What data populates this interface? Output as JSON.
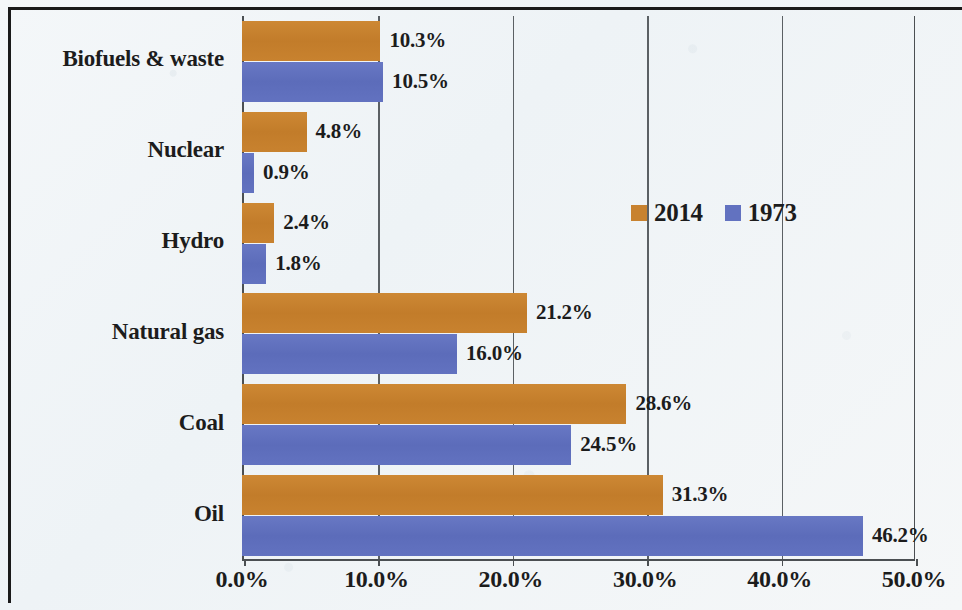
{
  "chart_data": {
    "type": "bar",
    "orientation": "horizontal",
    "title": "",
    "subtitle": "",
    "xlabel": "",
    "ylabel": "",
    "xlim": [
      0,
      50
    ],
    "xtick_labels": [
      "0.0%",
      "10.0%",
      "20.0%",
      "30.0%",
      "40.0%",
      "50.0%"
    ],
    "xticks": [
      0,
      10,
      20,
      30,
      40,
      50
    ],
    "grid": true,
    "grid_axis": "x",
    "legend_position": "inside-right-upper",
    "categories": [
      "Biofuels & waste",
      "Nuclear",
      "Hydro",
      "Natural gas",
      "Coal",
      "Oil"
    ],
    "series": [
      {
        "name": "2014",
        "color": "#c8822f",
        "values": [
          10.3,
          4.8,
          2.4,
          21.2,
          28.6,
          31.3
        ],
        "labels": [
          "10.3%",
          "4.8%",
          "2.4%",
          "21.2%",
          "28.6%",
          "31.3%"
        ]
      },
      {
        "name": "1973",
        "color": "#6272c0",
        "values": [
          10.5,
          0.9,
          1.8,
          16.0,
          24.5,
          46.2
        ],
        "labels": [
          "10.5%",
          "0.9%",
          "1.8%",
          "16.0%",
          "24.5%",
          "46.2%"
        ]
      }
    ]
  },
  "legend": {
    "entries": [
      {
        "label": "2014",
        "swatch_name": "legend-swatch-2014"
      },
      {
        "label": "1973",
        "swatch_name": "legend-swatch-1973"
      }
    ]
  },
  "colors": {
    "series_2014": "#c8822f",
    "series_1973": "#6272c0",
    "axis": "#4b4f52",
    "grid": "#5b6064",
    "text": "#1c1c1c",
    "background": "#f3f6f8",
    "frame": "#1a1a1a"
  }
}
